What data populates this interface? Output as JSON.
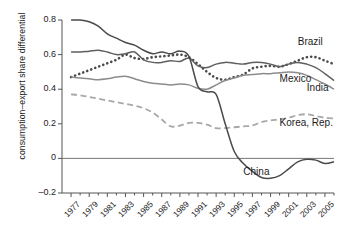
{
  "chart_data": {
    "type": "line",
    "title": "",
    "xlabel": "",
    "ylabel": "consumption–export share differential",
    "xlim": [
      1976,
      2006
    ],
    "ylim": [
      -0.2,
      0.8
    ],
    "yticks": [
      -0.2,
      0,
      0.2,
      0.4,
      0.6,
      0.8
    ],
    "ytick_labels": [
      "–0.2",
      "0",
      "0.2",
      "0.4",
      "0.6",
      "0.8"
    ],
    "xticks": [
      1977,
      1979,
      1981,
      1983,
      1985,
      1987,
      1989,
      1991,
      1993,
      1995,
      1997,
      1999,
      2001,
      2003,
      2005
    ],
    "xtick_labels": [
      "1977",
      "1979",
      "1981",
      "1983",
      "1985",
      "1987",
      "1989",
      "1991",
      "1993",
      "1995",
      "1997",
      "1999",
      "2001",
      "2003",
      "2005"
    ],
    "grid": false,
    "legend": "inline-annotations",
    "zero_line": true,
    "x": [
      1977,
      1978,
      1979,
      1980,
      1981,
      1982,
      1983,
      1984,
      1985,
      1986,
      1987,
      1988,
      1989,
      1990,
      1991,
      1992,
      1993,
      1994,
      1995,
      1996,
      1997,
      1998,
      1999,
      2000,
      2001,
      2002,
      2003,
      2004,
      2005,
      2006
    ],
    "series": [
      {
        "name": "Brazil",
        "style": "dotted",
        "color": "#4a4a4a",
        "values": [
          0.47,
          0.49,
          0.51,
          0.53,
          0.55,
          0.57,
          0.6,
          0.58,
          0.575,
          0.585,
          0.59,
          0.595,
          0.6,
          0.585,
          0.545,
          0.5,
          0.465,
          0.455,
          0.47,
          0.485,
          0.52,
          0.53,
          0.535,
          0.53,
          0.545,
          0.565,
          0.585,
          0.585,
          0.565,
          0.545
        ]
      },
      {
        "name": "Mexico",
        "style": "solid",
        "color": "#8c8c8c",
        "values": [
          0.47,
          0.465,
          0.46,
          0.455,
          0.46,
          0.47,
          0.475,
          0.46,
          0.445,
          0.435,
          0.43,
          0.425,
          0.43,
          0.425,
          0.405,
          0.4,
          0.425,
          0.45,
          0.465,
          0.48,
          0.485,
          0.49,
          0.49,
          0.495,
          0.5,
          0.495,
          0.48,
          0.455,
          0.43,
          0.4
        ]
      },
      {
        "name": "India",
        "style": "solid",
        "color": "#5f5f5f",
        "values": [
          0.615,
          0.615,
          0.62,
          0.625,
          0.615,
          0.6,
          0.605,
          0.615,
          0.57,
          0.555,
          0.555,
          0.565,
          0.56,
          0.58,
          0.535,
          0.525,
          0.545,
          0.555,
          0.55,
          0.545,
          0.555,
          0.555,
          0.545,
          0.53,
          0.545,
          0.555,
          0.545,
          0.525,
          0.49,
          0.45
        ]
      },
      {
        "name": "Korea, Rep.",
        "style": "dashed",
        "color": "#a8a8a8",
        "values": [
          0.37,
          0.365,
          0.355,
          0.345,
          0.335,
          0.325,
          0.315,
          0.305,
          0.29,
          0.265,
          0.225,
          0.185,
          0.19,
          0.205,
          0.205,
          0.195,
          0.175,
          0.175,
          0.18,
          0.185,
          0.19,
          0.21,
          0.22,
          0.225,
          0.235,
          0.25,
          0.255,
          0.245,
          0.235,
          0.23
        ]
      },
      {
        "name": "China",
        "style": "solid",
        "color": "#4a4a4a",
        "values": [
          0.8,
          0.8,
          0.79,
          0.765,
          0.72,
          0.695,
          0.67,
          0.655,
          0.625,
          0.605,
          0.615,
          0.605,
          0.62,
          0.59,
          0.415,
          0.385,
          0.37,
          0.2,
          0.04,
          -0.03,
          -0.075,
          -0.11,
          -0.115,
          -0.1,
          -0.06,
          -0.02,
          -0.005,
          -0.01,
          -0.03,
          -0.02
        ]
      }
    ],
    "annotations": [
      {
        "label": "Brazil",
        "x": 2002,
        "y": 0.665
      },
      {
        "label": "Mexico",
        "x": 2000,
        "y": 0.455
      },
      {
        "label": "India",
        "x": 2003,
        "y": 0.4
      },
      {
        "label": "Korea, Rep.",
        "x": 2000,
        "y": 0.2
      },
      {
        "label": "China",
        "x": 1996,
        "y": -0.085
      }
    ]
  }
}
